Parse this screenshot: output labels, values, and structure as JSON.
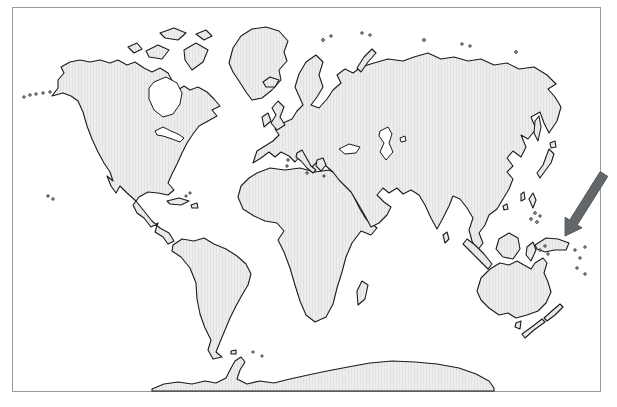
{
  "figure": {
    "kind": "world-map-with-highlight-arrow",
    "projection": "robinson-style world map",
    "highlight": {
      "marker": "arrow",
      "direction": "pointing down-left",
      "target_region": "new-guinea-eastern-indonesia"
    },
    "regions": [
      "north-america",
      "greenland",
      "arctic-islands",
      "iceland",
      "south-america",
      "falkland-islands",
      "caribbean-islands",
      "africa",
      "madagascar",
      "eurasia",
      "british-isles",
      "novaya-zemlya",
      "sakhalin",
      "japan",
      "taiwan",
      "hainan",
      "sri-lanka",
      "philippines",
      "sumatra",
      "java",
      "borneo",
      "sulawesi",
      "new-guinea",
      "melanesia-islands",
      "australia",
      "tasmania",
      "new-zealand",
      "antarctica",
      "hudson-bay",
      "great-lakes",
      "black-sea",
      "caspian-sea",
      "aral-sea",
      "aleutian-islands",
      "hawaii",
      "arctic-small-islands"
    ]
  },
  "colors": {
    "background": "#ffffff",
    "water": "#ffffff",
    "land_base": "#ededed",
    "land_stripe": "#e1e1e1",
    "coastline": "#1b1b1b",
    "frame": "#9a9a9a",
    "arrow_fill": "#63676a",
    "arrow_edge": "#55595c"
  }
}
